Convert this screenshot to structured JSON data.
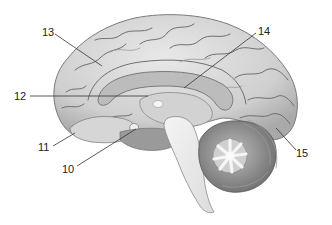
{
  "figure": {
    "colors": {
      "background": "#ffffff",
      "cortex": "#d9d9d9",
      "cortex_shadow": "#a8a8a8",
      "corpus_callosum": "#bdbdbd",
      "brainstem": "#ececec",
      "cerebellum": "#8c8c8c",
      "arbor_vitae": "#f2f2f2",
      "label_text": "#222222",
      "leader_line": "#333333"
    },
    "labels": [
      {
        "id": "label-10",
        "text": "10",
        "x": 62,
        "y": 173,
        "target_x": 136,
        "target_y": 129
      },
      {
        "id": "label-11",
        "text": "11",
        "x": 38,
        "y": 151,
        "target_x": 75,
        "target_y": 133
      },
      {
        "id": "label-12",
        "text": "12",
        "x": 14,
        "y": 100,
        "target_x": 148,
        "target_y": 96
      },
      {
        "id": "label-13",
        "text": "13",
        "x": 42,
        "y": 36,
        "target_x": 102,
        "target_y": 66
      },
      {
        "id": "label-14",
        "text": "14",
        "x": 258,
        "y": 35,
        "target_x": 184,
        "target_y": 88
      },
      {
        "id": "label-15",
        "text": "15",
        "x": 296,
        "y": 157,
        "target_x": 276,
        "target_y": 128
      }
    ]
  }
}
